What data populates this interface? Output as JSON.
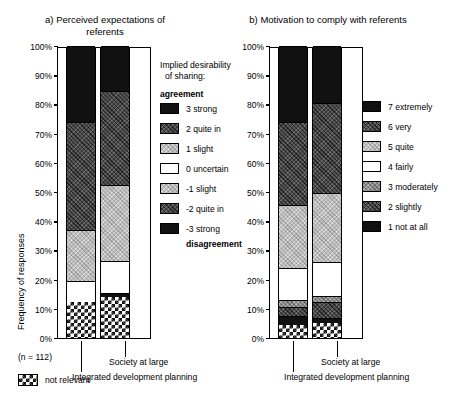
{
  "figure": {
    "panel_a_title": "a) Perceived expectations of referents",
    "panel_b_title": "b) Motivation to comply with referents",
    "y_axis_label": "Frequency of responses",
    "sample_size": "(n = 112)",
    "not_relevant_label": "not relevant",
    "category_label_1": "Integrated development planning",
    "category_label_2": "Society at large",
    "y_ticks": [
      "100%",
      "90%",
      "80%",
      "70%",
      "60%",
      "50%",
      "40%",
      "30%",
      "20%",
      "10%",
      "0%"
    ]
  },
  "legend_a": {
    "header_line1": "Implied desirability",
    "header_line2": "of sharing:",
    "top_label": "agreement",
    "bottom_label": "disagreement",
    "items": [
      {
        "label": "3 strong",
        "fill": "f-black"
      },
      {
        "label": "2 quite in",
        "fill": "f-dark"
      },
      {
        "label": "1 slight",
        "fill": "f-light"
      },
      {
        "label": "0 uncertain",
        "fill": "f-white"
      },
      {
        "label": "-1 slight",
        "fill": "f-light"
      },
      {
        "label": "-2 quite in",
        "fill": "f-dark"
      },
      {
        "label": "-3 strong",
        "fill": "f-black"
      }
    ]
  },
  "legend_b": {
    "items": [
      {
        "label": "7 extremely",
        "fill": "f-black"
      },
      {
        "label": "6 very",
        "fill": "f-dark"
      },
      {
        "label": "5 quite",
        "fill": "f-light"
      },
      {
        "label": "4 fairly",
        "fill": "f-white"
      },
      {
        "label": "3 moderately",
        "fill": "f-mid"
      },
      {
        "label": "2 slightly",
        "fill": "f-dark"
      },
      {
        "label": "1 not at all",
        "fill": "f-black"
      }
    ]
  },
  "chart_data": {
    "type": "bar",
    "subtype": "stacked-percentage",
    "xlabel": "",
    "ylabel": "Frequency of responses",
    "ylim": [
      0,
      100
    ],
    "yunit": "%",
    "ytick_values": [
      0,
      10,
      20,
      30,
      40,
      50,
      60,
      70,
      80,
      90,
      100
    ],
    "grid": false,
    "legend_position": "right",
    "n": 112,
    "panels": [
      {
        "panel": "a",
        "title": "a) Perceived expectations of referents",
        "categories": [
          "Integrated development planning",
          "Society at large"
        ],
        "series": [
          {
            "name": "not relevant",
            "fill": "f-check",
            "values": [
              12.5,
              14.0
            ]
          },
          {
            "name": "-3 strong disagreement",
            "fill": "f-black",
            "values": [
              0.0,
              1.5
            ]
          },
          {
            "name": "-2 quite in disagreement",
            "fill": "f-dark",
            "values": [
              0.0,
              0.0
            ]
          },
          {
            "name": "-1 slight disagreement",
            "fill": "f-light",
            "values": [
              0.0,
              0.0
            ]
          },
          {
            "name": "0 uncertain",
            "fill": "f-white",
            "values": [
              7.0,
              11.0
            ]
          },
          {
            "name": "1 slight agreement",
            "fill": "f-light",
            "values": [
              17.5,
              26.0
            ]
          },
          {
            "name": "2 quite in agreement",
            "fill": "f-dark",
            "values": [
              37.0,
              32.0
            ]
          },
          {
            "name": "3 strong agreement",
            "fill": "f-black",
            "values": [
              26.0,
              15.5
            ]
          }
        ]
      },
      {
        "panel": "b",
        "title": "b) Motivation to comply with referents",
        "categories": [
          "Integrated development planning",
          "Society at large"
        ],
        "series": [
          {
            "name": "not relevant",
            "fill": "f-check",
            "values": [
              4.5,
              5.0
            ]
          },
          {
            "name": "1 not at all",
            "fill": "f-black",
            "values": [
              3.0,
              2.0
            ]
          },
          {
            "name": "2 slightly",
            "fill": "f-dark",
            "values": [
              3.0,
              5.5
            ]
          },
          {
            "name": "3 moderately",
            "fill": "f-mid",
            "values": [
              2.5,
              2.0
            ]
          },
          {
            "name": "4 fairly",
            "fill": "f-white",
            "values": [
              11.0,
              11.5
            ]
          },
          {
            "name": "5 quite",
            "fill": "f-light",
            "values": [
              21.5,
              23.5
            ]
          },
          {
            "name": "6 very",
            "fill": "f-dark",
            "values": [
              28.5,
              31.0
            ]
          },
          {
            "name": "7 extremely",
            "fill": "f-black",
            "values": [
              26.0,
              19.5
            ]
          }
        ]
      }
    ]
  }
}
